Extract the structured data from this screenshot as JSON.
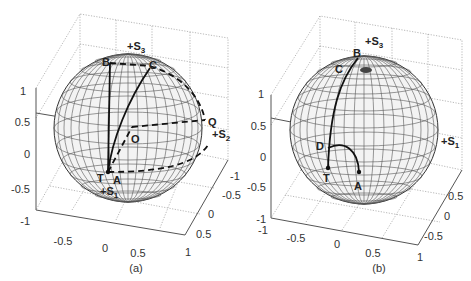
{
  "figure": {
    "panels": [
      {
        "id": "a",
        "caption": "(a)",
        "z_ticks": [
          "1",
          "0.5",
          "0",
          "-0.5",
          "-1"
        ],
        "x_ticks": [
          "-0.5",
          "0",
          "0.5",
          "1"
        ],
        "y_ticks": [
          "-1",
          "-0.5",
          "0",
          "0.5",
          "1"
        ],
        "axis_labels": {
          "s3": "+S",
          "s3_sub": "3",
          "s2": "+S",
          "s2_sub": "2",
          "s1": "+S",
          "s1_sub": "1"
        },
        "points": {
          "B": "B",
          "C": "C",
          "Q": "Q",
          "O": "O",
          "T": "T",
          "A": "A"
        }
      },
      {
        "id": "b",
        "caption": "(b)",
        "z_ticks": [
          "1",
          "0.5",
          "0",
          "-0.5",
          "-1"
        ],
        "x_ticks": [
          "-1",
          "-0.5",
          "0",
          "0.5",
          "1"
        ],
        "y_ticks": [
          "0.5",
          "0",
          "-0.5"
        ],
        "axis_labels": {
          "s3": "+S",
          "s3_sub": "3",
          "s1": "+S",
          "s1_sub": "1"
        },
        "points": {
          "B": "B",
          "C": "C",
          "D": "D",
          "T": "T",
          "A": "A"
        }
      }
    ]
  }
}
